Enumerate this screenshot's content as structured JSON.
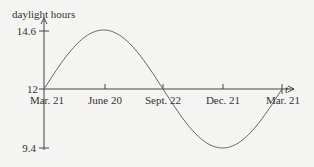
{
  "chart_data": {
    "type": "line",
    "title": "",
    "ylabel": "daylight hours",
    "xlabel": "t",
    "x_ticks": [
      "Mar. 21",
      "June 20",
      "Sept. 22",
      "Dec. 21",
      "Mar. 21"
    ],
    "y_ticks": [
      14.6,
      12,
      9.4
    ],
    "y_tick_labels": [
      "14.6",
      "12",
      "9.4"
    ],
    "ylim": [
      9.4,
      14.6
    ],
    "grid": false,
    "legend": null,
    "series": [
      {
        "name": "daylight hours",
        "x": [
          "Mar. 21",
          "June 20",
          "Sept. 22",
          "Dec. 21",
          "Mar. 21"
        ],
        "values": [
          12,
          14.6,
          12,
          9.4,
          12
        ],
        "shape": "sinusoid"
      }
    ]
  }
}
